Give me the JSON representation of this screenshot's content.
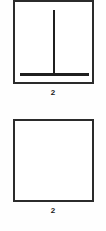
{
  "document": {
    "background_color": "#fefefe",
    "ink_color": "#2b2b2b"
  },
  "figures": [
    {
      "panel_name": "panel-with-tee-figure",
      "caption": "2",
      "content": "inverted-t-line-drawing",
      "stroke_color": "#1f1f1f"
    },
    {
      "panel_name": "empty-panel",
      "caption": "2",
      "content": "empty",
      "stroke_color": "#2b2b2b"
    }
  ]
}
